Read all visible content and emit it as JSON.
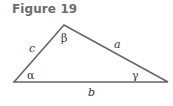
{
  "figure": {
    "title": "Figure 19"
  },
  "triangle": {
    "vertices": {
      "left": [
        14,
        82
      ],
      "top": [
        64,
        25
      ],
      "right": [
        168,
        82
      ]
    },
    "stroke": "#666666",
    "sides": {
      "a": "a",
      "b": "b",
      "c": "c"
    },
    "angles": {
      "alpha": "α",
      "beta": "β",
      "gamma": "γ"
    }
  }
}
